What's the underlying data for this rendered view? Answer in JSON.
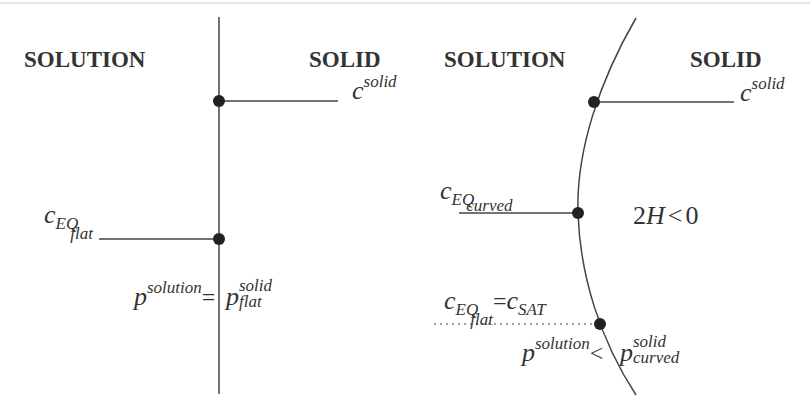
{
  "left_panel": {
    "solution_label": "SOLUTION",
    "solid_label": "SOLID",
    "c_solid": {
      "base": "c",
      "sup": "solid"
    },
    "c_eq_flat": {
      "base": "c",
      "sub": "EQ",
      "subsub": "flat"
    },
    "equation": {
      "lhs_base": "p",
      "lhs_sup": "solution",
      "operator": "=",
      "rhs_base": "p",
      "rhs_sup": "solid",
      "rhs_sub": "flat"
    }
  },
  "right_panel": {
    "solution_label": "SOLUTION",
    "solid_label": "SOLID",
    "c_solid": {
      "base": "c",
      "sup": "solid"
    },
    "c_eq_curved": {
      "base": "c",
      "sub": "EQ",
      "subsub": "curved"
    },
    "curvature": {
      "prefix": "2",
      "var": "H",
      "relation": "<",
      "value": "0"
    },
    "c_eq_flat_sat": {
      "base": "c",
      "sub": "EQ",
      "subsub": "flat",
      "operator": "=",
      "rhs_base": "c",
      "rhs_sub": "SAT"
    },
    "equation": {
      "lhs_base": "p",
      "lhs_sup": "solution",
      "operator": "<",
      "rhs_base": "p",
      "rhs_sup": "solid",
      "rhs_sub": "curved"
    }
  },
  "colors": {
    "ink": "#333333",
    "line": "#444444",
    "dot": "#222222"
  }
}
